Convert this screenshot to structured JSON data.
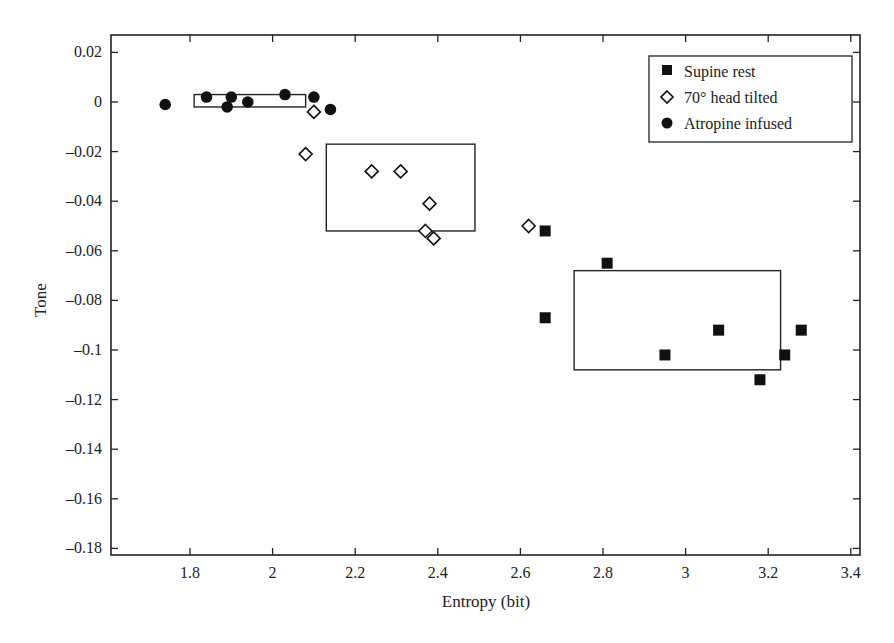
{
  "chart_data": {
    "type": "scatter",
    "title": "",
    "xlabel": "Entropy (bit)",
    "ylabel": "Tone",
    "xlim": [
      1.6,
      3.41
    ],
    "ylim": [
      -0.182,
      0.027
    ],
    "xticks": [
      1.8,
      2,
      2.2,
      2.4,
      2.6,
      2.8,
      3,
      3.2,
      3.4
    ],
    "xtick_labels": [
      "1.8",
      "2",
      "2.2",
      "2.4",
      "2.6",
      "2.8",
      "3",
      "3.2",
      "3.4"
    ],
    "yticks": [
      0.02,
      0,
      -0.02,
      -0.04,
      -0.06,
      -0.08,
      -0.1,
      -0.12,
      -0.14,
      -0.16,
      -0.18
    ],
    "ytick_labels": [
      "0.02",
      "0",
      "–0.02",
      "–0.04",
      "–0.06",
      "–0.08",
      "–0.1",
      "–0.12",
      "–0.14",
      "–0.16",
      "–0.18"
    ],
    "grid": false,
    "legend_position": "upper right",
    "series": [
      {
        "name": "Supine rest",
        "marker": "filled-square",
        "color": "#111111",
        "points": [
          [
            2.66,
            -0.052
          ],
          [
            2.81,
            -0.065
          ],
          [
            2.66,
            -0.087
          ],
          [
            2.95,
            -0.102
          ],
          [
            3.08,
            -0.092
          ],
          [
            3.18,
            -0.112
          ],
          [
            3.24,
            -0.102
          ],
          [
            3.28,
            -0.092
          ]
        ]
      },
      {
        "name": "70° head tilted",
        "marker": "open-diamond",
        "color": "#111111",
        "points": [
          [
            2.1,
            -0.004
          ],
          [
            2.08,
            -0.021
          ],
          [
            2.24,
            -0.028
          ],
          [
            2.31,
            -0.028
          ],
          [
            2.38,
            -0.041
          ],
          [
            2.37,
            -0.052
          ],
          [
            2.39,
            -0.055
          ],
          [
            2.62,
            -0.05
          ]
        ]
      },
      {
        "name": "Atropine infused",
        "marker": "filled-circle",
        "color": "#111111",
        "points": [
          [
            1.74,
            -0.001
          ],
          [
            1.84,
            0.002
          ],
          [
            1.89,
            -0.002
          ],
          [
            1.9,
            0.002
          ],
          [
            1.94,
            0.0
          ],
          [
            2.03,
            0.003
          ],
          [
            2.1,
            0.002
          ],
          [
            2.14,
            -0.003
          ]
        ]
      }
    ],
    "annotations": [
      {
        "type": "rect",
        "group": "Atropine infused",
        "x0": 1.81,
        "x1": 2.08,
        "y0": -0.002,
        "y1": 0.003
      },
      {
        "type": "rect",
        "group": "70° head tilted",
        "x0": 2.13,
        "x1": 2.49,
        "y0": -0.052,
        "y1": -0.017
      },
      {
        "type": "rect",
        "group": "Supine rest",
        "x0": 2.73,
        "x1": 3.23,
        "y0": -0.108,
        "y1": -0.068
      }
    ]
  },
  "legend": {
    "items": [
      "Supine rest",
      "70° head tilted",
      "Atropine infused"
    ]
  },
  "axes": {
    "xlabel": "Entropy (bit)",
    "ylabel": "Tone"
  }
}
